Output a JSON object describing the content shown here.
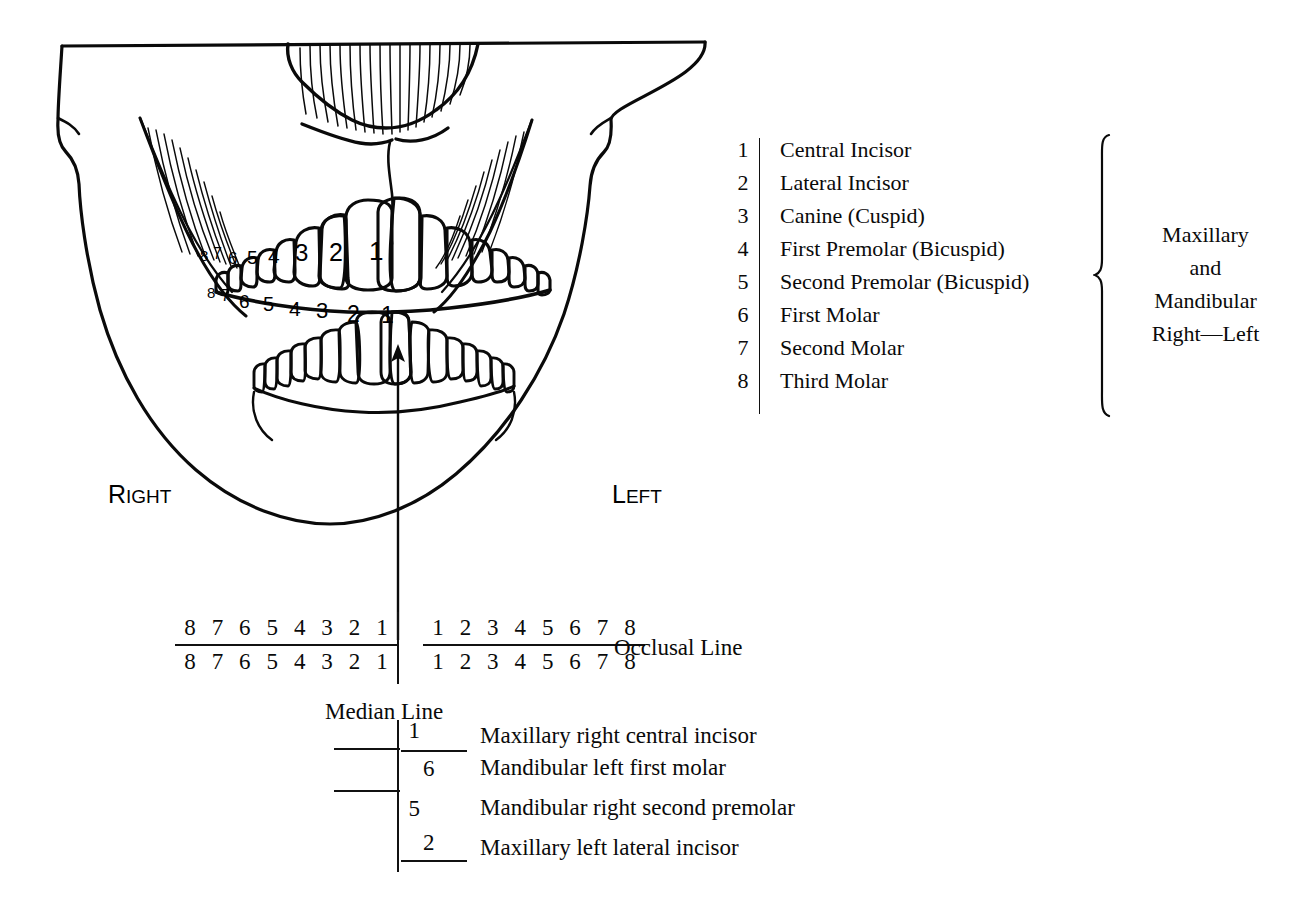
{
  "figure": {
    "tooth_numbers_upper": [
      "8",
      "7",
      "6",
      "5",
      "4",
      "3",
      "2",
      "1"
    ],
    "tooth_numbers_lower": [
      "8",
      "7",
      "6",
      "5",
      "4",
      "3",
      "2",
      "1"
    ],
    "side_right": {
      "initial": "R",
      "rest": "IGHT"
    },
    "side_left": {
      "initial": "L",
      "rest": "EFT"
    }
  },
  "legend": {
    "items": [
      {
        "num": "1",
        "label": "Central Incisor"
      },
      {
        "num": "2",
        "label": "Lateral Incisor"
      },
      {
        "num": "3",
        "label": "Canine (Cuspid)"
      },
      {
        "num": "4",
        "label": "First Premolar (Bicuspid)"
      },
      {
        "num": "5",
        "label": "Second Premolar (Bicuspid)"
      },
      {
        "num": "6",
        "label": "First Molar"
      },
      {
        "num": "7",
        "label": "Second Molar"
      },
      {
        "num": "8",
        "label": "Third Molar"
      }
    ],
    "brace_lines": [
      "Maxillary",
      "and",
      "Mandibular",
      "Right—Left"
    ]
  },
  "occlusal": {
    "upper_right_quadrant": [
      "8",
      "7",
      "6",
      "5",
      "4",
      "3",
      "2",
      "1"
    ],
    "lower_right_quadrant": [
      "8",
      "7",
      "6",
      "5",
      "4",
      "3",
      "2",
      "1"
    ],
    "upper_left_quadrant": [
      "1",
      "2",
      "3",
      "4",
      "5",
      "6",
      "7",
      "8"
    ],
    "lower_left_quadrant": [
      "1",
      "2",
      "3",
      "4",
      "5",
      "6",
      "7",
      "8"
    ],
    "occlusal_label": "Occlusal Line",
    "median_label": "Median Line"
  },
  "examples": [
    {
      "digit": "1",
      "quadrant": "upper-left",
      "text": "Maxillary right central incisor"
    },
    {
      "digit": "6",
      "quadrant": "lower-right",
      "text": "Mandibular left first molar"
    },
    {
      "digit": "5",
      "quadrant": "lower-left",
      "text": "Mandibular right second premolar"
    },
    {
      "digit": "2",
      "quadrant": "upper-right",
      "text": "Maxillary left lateral incisor"
    }
  ],
  "colors": {
    "ink": "#0a0a0a",
    "background": "#ffffff"
  }
}
